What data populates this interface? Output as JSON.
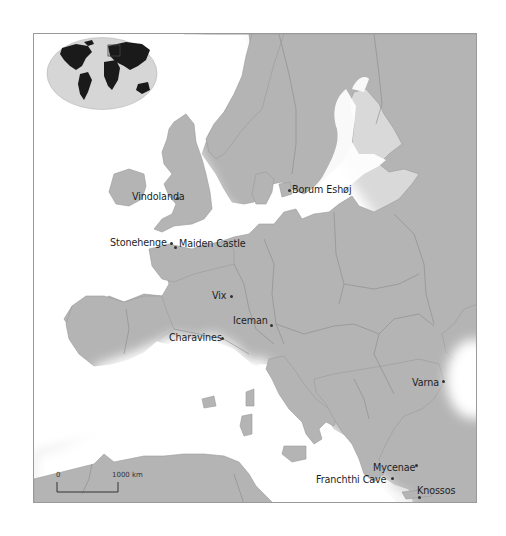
{
  "map": {
    "title": "",
    "colors": {
      "land": "#b4b4b4",
      "land_border": "#8c8c8c",
      "sea": "#ffffff",
      "frame": "#9a9a9a",
      "text": "#1e1e1e",
      "inset_ocean": "#d6d6d6",
      "inset_land": "#1a1a1a"
    },
    "inset": {
      "name": "world-locator-map",
      "highlight": "Europe"
    },
    "scale_bar": {
      "start_label": "0",
      "end_label": "1000 km"
    },
    "sites": [
      {
        "name": "Vindolanda",
        "label": "Vindolanda"
      },
      {
        "name": "Stonehenge",
        "label": "Stonehenge"
      },
      {
        "name": "Maiden Castle",
        "label": "Maiden Castle"
      },
      {
        "name": "Borum Eshøj",
        "label": "Borum Eshøj"
      },
      {
        "name": "Vix",
        "label": "Vix"
      },
      {
        "name": "Iceman",
        "label": "Iceman"
      },
      {
        "name": "Charavines",
        "label": "Charavines"
      },
      {
        "name": "Varna",
        "label": "Varna"
      },
      {
        "name": "Mycenae",
        "label": "Mycenae"
      },
      {
        "name": "Franchthi Cave",
        "label": "Franchthi Cave"
      },
      {
        "name": "Knossos",
        "label": "Knossos"
      }
    ]
  }
}
